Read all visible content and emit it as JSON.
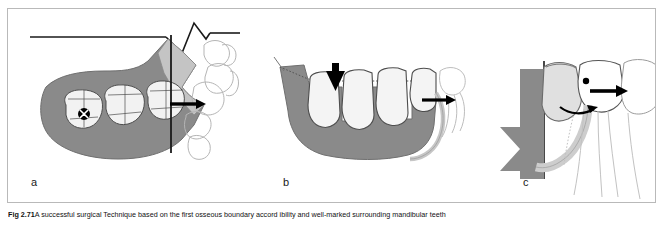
{
  "figure": {
    "panels": [
      {
        "id": "a",
        "label": "a",
        "view": "occlusal view of mandible with molars, reference lines and eruption arrow",
        "elements": {
          "horizontal_reference_line": "horizontal-reference-line",
          "vertical_reference_line": "vertical-reference-line",
          "zigzag_crest": "zigzag-bone-crest",
          "bone_shading": "mandibular-bone-shaded-region",
          "molars": [
            "first-molar",
            "second-molar",
            "third-molar"
          ],
          "marker": "extraction-site-x-marker",
          "arrow": "mesial-drift-arrow"
        }
      },
      {
        "id": "b",
        "label": "b",
        "view": "buccal view of mandible with teeth and vertical loading arrow",
        "elements": {
          "bone_shading": "mandibular-body-shaded-region",
          "teeth": [
            "premolar",
            "first-molar",
            "second-molar",
            "third-molar"
          ],
          "down_arrow": "occlusal-load-arrow",
          "side_arrow": "horizontal-force-arrow",
          "canal": "inferior-alveolar-canal"
        }
      },
      {
        "id": "c",
        "label": "c",
        "view": "close-up cross-section with wedge, horizontal arrow and curved arrow",
        "elements": {
          "wedge": "dark-gray-wedge-shape",
          "vertical_line": "vertical-reference-line",
          "crown": "impacted-tooth-crown",
          "canal": "inferior-alveolar-canal",
          "straight_arrow": "pressure-direction-arrow",
          "curved_arrow": "rotation-direction-arrow",
          "dot": "contact-point-dot",
          "roots": "adjacent-tooth-roots"
        }
      }
    ],
    "colors": {
      "bone_gray": "#8a8a8a",
      "wedge_gray": "#808080",
      "tooth_fill": "#efefef",
      "crown_light": "#e3e3e3",
      "canal_gray": "#cfcfcf",
      "outline": "#4d4d4d",
      "faint_outline": "#c8c8c8",
      "arrow_black": "#000000",
      "frame_border": "#b9b9b9"
    }
  },
  "caption": {
    "figure_number": "Fig 2.71",
    "text": "A successful surgical Technique based on the first osseous boundary accord ibility and well-marked surrounding mandibular teeth"
  }
}
